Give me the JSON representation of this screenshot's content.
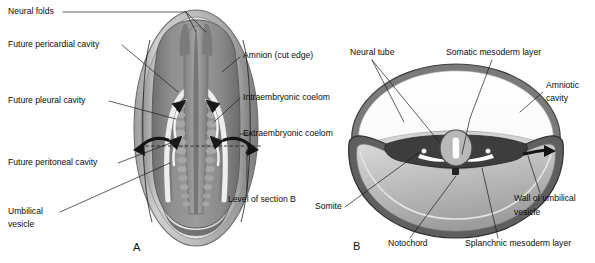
{
  "figure": {
    "panels": [
      {
        "id": "A",
        "letter": "A",
        "x": 133,
        "y": 248
      },
      {
        "id": "B",
        "letter": "B",
        "x": 353,
        "y": 247
      }
    ]
  },
  "panel_a": {
    "letter": "A",
    "labels": [
      {
        "name": "neural-folds",
        "text": "Neural folds",
        "x": 8,
        "y": 12,
        "anchor": "start"
      },
      {
        "name": "future-pericardial-cavity",
        "text": "Future pericardial cavity",
        "x": 8,
        "y": 45,
        "anchor": "start"
      },
      {
        "name": "future-pleural-cavity",
        "text": "Future pleural cavity",
        "x": 8,
        "y": 101,
        "anchor": "start"
      },
      {
        "name": "future-peritoneal-cavity",
        "text": "Future peritoneal cavity",
        "x": 8,
        "y": 163,
        "anchor": "start"
      },
      {
        "name": "umbilical-vesicle-line1",
        "text": "Umbilical",
        "x": 8,
        "y": 212,
        "anchor": "start"
      },
      {
        "name": "umbilical-vesicle-line2",
        "text": "vesicle",
        "x": 8,
        "y": 225,
        "anchor": "start"
      },
      {
        "name": "amnion-cut-edge",
        "text": "Amnion (cut edge)",
        "x": 243,
        "y": 56,
        "anchor": "start"
      },
      {
        "name": "intraembryonic-coelom",
        "text": "Intraembryonic coelom",
        "x": 243,
        "y": 98,
        "anchor": "start"
      },
      {
        "name": "extraembryonic-coelom",
        "text": "Extraembryonic coelom",
        "x": 243,
        "y": 134,
        "anchor": "start"
      },
      {
        "name": "level-of-section-b",
        "text": "Level of section B",
        "x": 228,
        "y": 200,
        "anchor": "start"
      }
    ]
  },
  "panel_b": {
    "letter": "B",
    "labels": [
      {
        "name": "neural-tube",
        "text": "Neural tube",
        "x": 350,
        "y": 53,
        "anchor": "start"
      },
      {
        "name": "somatic-mesoderm-layer",
        "text": "Somatic mesoderm layer",
        "x": 446,
        "y": 53,
        "anchor": "start"
      },
      {
        "name": "amniotic-cavity-line1",
        "text": "Amniotic",
        "x": 546,
        "y": 86,
        "anchor": "start"
      },
      {
        "name": "amniotic-cavity-line2",
        "text": "cavity",
        "x": 546,
        "y": 99,
        "anchor": "start"
      },
      {
        "name": "somite",
        "text": "Somite",
        "x": 315,
        "y": 207,
        "anchor": "start"
      },
      {
        "name": "notochord",
        "text": "Notochord",
        "x": 388,
        "y": 244,
        "anchor": "start"
      },
      {
        "name": "splanchnic-mesoderm-layer",
        "text": "Splanchnic mesoderm layer",
        "x": 465,
        "y": 244,
        "anchor": "start"
      },
      {
        "name": "wall-of-umbilical-line1",
        "text": "Wall of umbilical",
        "x": 514,
        "y": 199,
        "anchor": "start"
      },
      {
        "name": "wall-of-umbilical-line2",
        "text": "vesicle",
        "x": 514,
        "y": 213,
        "anchor": "start"
      }
    ]
  },
  "colors": {
    "background": "#ffffff",
    "text": "#0b0b0b",
    "leader": "#1a1a1a",
    "amnion_outer": "#b9b9b9",
    "amnion_mid": "#9a9a9a",
    "amnion_highlight": "#f3f3f3",
    "embryo_body": "#8a8a8a",
    "embryo_body_dark": "#6d6d6d",
    "neural_groove": "#7a7a7a",
    "somite_light": "#a3a3a3",
    "coelom_fill": "#d4d4d4",
    "umbilical_vesicle": "#c0c0c0",
    "ectoderm_dark": "#4a4a4a",
    "mesoderm_dark": "#3a3a3a",
    "notochord": "#2b2b2b",
    "arrow": "#141414"
  },
  "legend_notes": {
    "dashed_line_meaning": "Level of section B",
    "arrow_meaning": "Direction of embryonic folding"
  }
}
